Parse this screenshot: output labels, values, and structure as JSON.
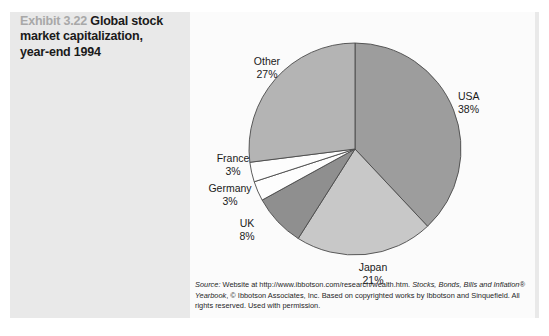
{
  "exhibit": {
    "number": "Exhibit 3.22",
    "title_line_1": "Global stock",
    "title_line_2": "market capitalization,",
    "title_line_3": "year-end 1994"
  },
  "source": {
    "label": "Source:",
    "line_1": " Website at http://www.ibbotson.com/research/wealth.htm. ",
    "italic_1": "Stocks, Bonds, Bills",
    "line_2": "and Inflation® Yearbook",
    "line_3": ", © Ibbotson Associates, Inc. Based on copyrighted works by",
    "line_4": "Ibbotson and Sinquefield. All rights reserved. Used with permission."
  },
  "chart_data": {
    "type": "pie",
    "title": "Global stock market capitalization, year-end 1994",
    "unit": "%",
    "start_angle_deg": 0,
    "direction": "clockwise",
    "categories": [
      "USA",
      "Japan",
      "UK",
      "Germany",
      "France",
      "Other"
    ],
    "values": [
      38,
      21,
      8,
      3,
      3,
      27
    ],
    "total": 100,
    "legend": "none",
    "labels_position": "outside",
    "slices": [
      {
        "name": "USA",
        "value": 38,
        "display": "38%",
        "color": "#9d9d9d",
        "start_deg": 0.0,
        "end_deg": 136.8
      },
      {
        "name": "Japan",
        "value": 21,
        "display": "21%",
        "color": "#c8c8c8",
        "start_deg": 136.8,
        "end_deg": 212.4
      },
      {
        "name": "UK",
        "value": 8,
        "display": "8%",
        "color": "#8f8f8f",
        "start_deg": 212.4,
        "end_deg": 241.2
      },
      {
        "name": "Germany",
        "value": 3,
        "display": "3%",
        "color": "#fdfdfd",
        "start_deg": 241.2,
        "end_deg": 252.0
      },
      {
        "name": "France",
        "value": 3,
        "display": "3%",
        "color": "#fdfdfd",
        "start_deg": 252.0,
        "end_deg": 262.8
      },
      {
        "name": "Other",
        "value": 27,
        "display": "27%",
        "color": "#b4b4b4",
        "start_deg": 262.8,
        "end_deg": 360.0
      }
    ]
  },
  "labels": {
    "usa": {
      "name": "USA",
      "value": "38%"
    },
    "japan": {
      "name": "Japan",
      "value": "21%"
    },
    "uk": {
      "name": "UK",
      "value": "8%"
    },
    "germany": {
      "name": "Germany",
      "value": "3%"
    },
    "france": {
      "name": "France",
      "value": "3%"
    },
    "other": {
      "name": "Other",
      "value": "27%"
    }
  },
  "colors": {
    "page_background": "#e9e9e9",
    "chart_panel": "#fbfbfb",
    "exhibit_number": "#a8a8a8",
    "title_text": "#1a1a1a",
    "slice_outline": "#4a4a4a"
  }
}
